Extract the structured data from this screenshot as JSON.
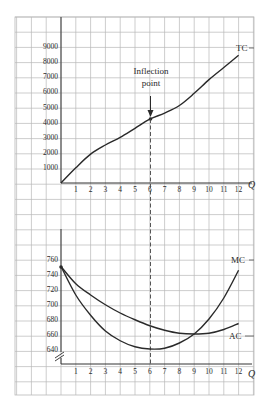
{
  "chart_data": [
    {
      "type": "line",
      "title": "",
      "xlabel": "Q",
      "ylabel": "",
      "x": [
        0,
        1,
        2,
        3,
        4,
        5,
        6,
        7,
        8,
        9,
        10,
        11,
        12
      ],
      "x_ticks": [
        "1",
        "2",
        "3",
        "4",
        "5",
        "6",
        "7",
        "8",
        "9",
        "10",
        "11",
        "12"
      ],
      "y_ticks": [
        "1000",
        "2000",
        "3000",
        "4000",
        "5000",
        "6000",
        "7000",
        "8000",
        "9000"
      ],
      "ylim": [
        0,
        10000
      ],
      "xlim": [
        0,
        12.9
      ],
      "grid": true,
      "series": [
        {
          "name": "TC",
          "values": [
            0,
            1000,
            1900,
            2500,
            3000,
            3600,
            4200,
            4600,
            5100,
            5900,
            6800,
            7600,
            8400
          ]
        }
      ],
      "annotations": [
        {
          "text_line1": "Inflection",
          "text_line2": "point",
          "x": 6,
          "y": 4200,
          "arrow": true
        }
      ],
      "legend": "inline labels at curve ends"
    },
    {
      "type": "line",
      "title": "",
      "xlabel": "Q",
      "ylabel": "",
      "x": [
        0,
        1,
        2,
        3,
        4,
        5,
        6,
        7,
        8,
        9,
        10,
        11,
        12
      ],
      "x_ticks": [
        "1",
        "2",
        "3",
        "4",
        "5",
        "6",
        "7",
        "8",
        "9",
        "10",
        "11",
        "12"
      ],
      "y_ticks": [
        "640",
        "660",
        "680",
        "700",
        "720",
        "740",
        "760"
      ],
      "ylim": [
        620,
        780
      ],
      "axis_break": true,
      "grid": true,
      "series": [
        {
          "name": "MC",
          "values": [
            750,
            712,
            685,
            664,
            651,
            643,
            640,
            641,
            648,
            660,
            680,
            708,
            745
          ]
        },
        {
          "name": "AC",
          "values": [
            750,
            727,
            712,
            699,
            688,
            679,
            671,
            665,
            661,
            660,
            661,
            666,
            674
          ]
        }
      ],
      "legend": "inline labels at curve ends"
    }
  ],
  "labels": {
    "tc": "TC",
    "mc": "MC",
    "ac": "AC",
    "q_top": "Q",
    "q_bottom": "Q",
    "inflection_1": "Inflection",
    "inflection_2": "point"
  },
  "colors": {
    "grid": "#b8b8b8",
    "axis": "#333333",
    "curve": "#2a2a2a"
  }
}
